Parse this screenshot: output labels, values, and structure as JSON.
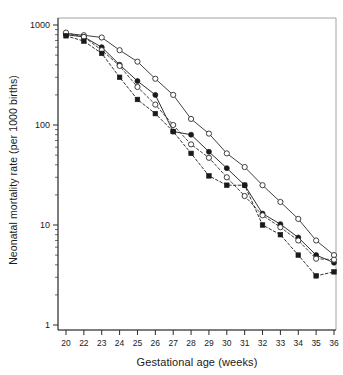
{
  "chart_data": {
    "type": "line",
    "title": "",
    "xlabel": "Gestational age (weeks)",
    "ylabel": "Neonatal mortality rate (per 1000 births)",
    "xlim": [
      20,
      36
    ],
    "ylim": [
      1,
      1000
    ],
    "yscale": "log",
    "grid": false,
    "legend": "none",
    "xticks": [
      20,
      22,
      23,
      24,
      25,
      26,
      27,
      28,
      29,
      30,
      31,
      32,
      33,
      34,
      35,
      36
    ],
    "xtick_labels": [
      "20",
      "22",
      "23",
      "24",
      "25",
      "26",
      "27",
      "28",
      "29",
      "30",
      "31",
      "32",
      "33",
      "34",
      "35",
      "36"
    ],
    "yticks": [
      1,
      10,
      100,
      1000
    ],
    "ytick_labels": [
      "1",
      "10",
      "100",
      "1000"
    ],
    "yminor_ticks": [
      2,
      3,
      4,
      5,
      6,
      7,
      8,
      9,
      20,
      30,
      40,
      50,
      60,
      70,
      80,
      90,
      200,
      300,
      400,
      500,
      600,
      700,
      800,
      900
    ],
    "x": [
      20,
      22,
      23,
      24,
      25,
      26,
      27,
      28,
      29,
      30,
      31,
      32,
      33,
      34,
      35,
      36
    ],
    "series": [
      {
        "name": "series-open-circle-solid-upper",
        "marker": "open-circle",
        "line": "solid",
        "color": "#2b2b2b",
        "values": [
          820,
          790,
          750,
          560,
          430,
          290,
          200,
          115,
          82,
          52,
          38,
          25,
          17,
          11.5,
          7.0,
          5.0
        ]
      },
      {
        "name": "series-filled-circle-solid",
        "marker": "filled-circle",
        "line": "solid",
        "color": "#1a1a1a",
        "values": [
          800,
          760,
          600,
          400,
          275,
          200,
          86,
          80,
          54,
          37,
          25,
          13.0,
          10.2,
          7.5,
          5.0,
          4.2
        ]
      },
      {
        "name": "series-open-circle-dashed",
        "marker": "open-circle",
        "line": "dashed",
        "color": "#2b2b2b",
        "values": [
          840,
          760,
          560,
          390,
          240,
          160,
          100,
          64,
          47,
          30,
          19.5,
          12.5,
          9.5,
          7.0,
          4.6,
          4.5
        ]
      },
      {
        "name": "series-filled-square-dashed",
        "marker": "filled-square",
        "line": "dashed",
        "color": "#1a1a1a",
        "values": [
          780,
          690,
          520,
          300,
          180,
          130,
          86,
          52,
          31,
          25,
          25,
          10.0,
          8.0,
          5.0,
          3.1,
          3.4
        ]
      }
    ]
  },
  "axis": {
    "x_title": "Gestational age (weeks)",
    "y_title": "Neonatal mortality rate (per 1000 births)"
  }
}
